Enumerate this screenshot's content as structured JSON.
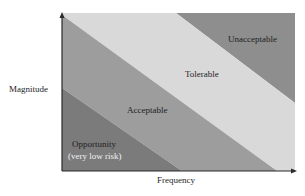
{
  "diagram": {
    "axes": {
      "y_label": "Magnitude",
      "x_label": "Frequency"
    },
    "regions": [
      {
        "id": "opportunity",
        "label": "Opportunity",
        "sublabel": "(very low risk)",
        "color": "#7b7b7b"
      },
      {
        "id": "acceptable",
        "label": "Acceptable",
        "color": "#9d9d9d"
      },
      {
        "id": "tolerable",
        "label": "Tolerable",
        "color": "#d9d9d9"
      },
      {
        "id": "unacceptable",
        "label": "Unacceptable",
        "color": "#8e8e8e"
      }
    ],
    "axis_color": "#2a2a2a"
  }
}
